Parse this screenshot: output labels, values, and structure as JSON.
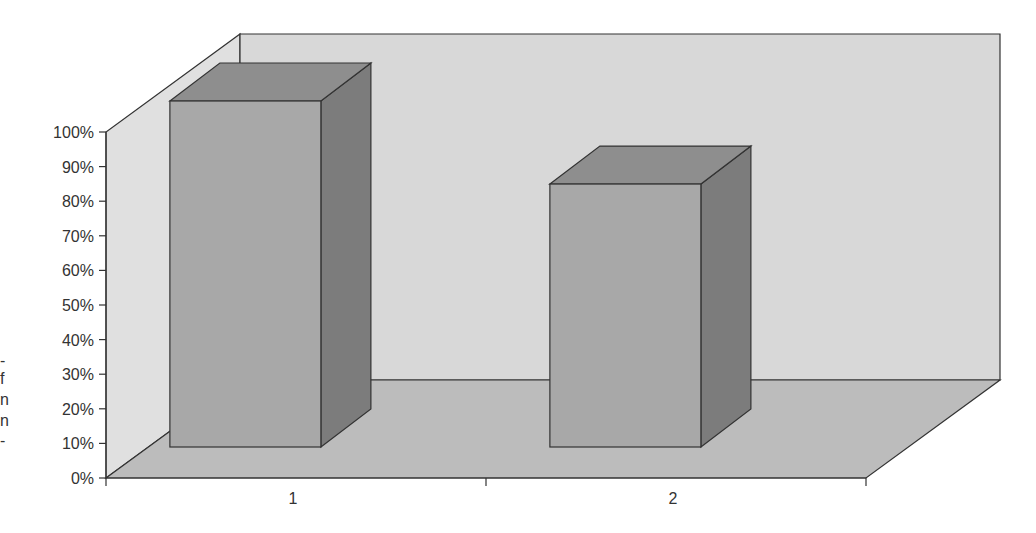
{
  "chart_data": {
    "type": "bar",
    "style": "3d-column",
    "title": "",
    "xlabel": "",
    "ylabel": "",
    "categories": [
      "1",
      "2"
    ],
    "values": [
      100,
      76
    ],
    "value_unit": "%",
    "ylim": [
      0,
      100
    ],
    "yticks": [
      "0%",
      "10%",
      "20%",
      "30%",
      "40%",
      "50%",
      "60%",
      "70%",
      "80%",
      "90%",
      "100%"
    ],
    "grid": false,
    "legend": null
  },
  "left_fragments": [
    "-",
    "f",
    "n",
    "n",
    "-"
  ],
  "colors": {
    "back_wall": "#d8d8d8",
    "side_wall": "#e0e0e0",
    "floor": "#bcbcbc",
    "bar_front": "#a8a8a8",
    "bar_top": "#8e8e8e",
    "bar_side": "#7c7c7c",
    "line": "#333333"
  }
}
